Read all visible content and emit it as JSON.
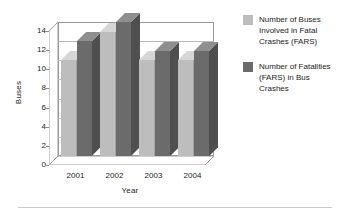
{
  "chart_data": {
    "type": "bar",
    "title": "",
    "subtitle": "",
    "xlabel": "Year",
    "ylabel": "Buses",
    "categories": [
      "2001",
      "2002",
      "2003",
      "2004"
    ],
    "series": [
      {
        "name": "Number of Buses Involved in Fatal Crashes (FARS)",
        "values": [
          10,
          13,
          10,
          10
        ],
        "color": "#bdbdbd"
      },
      {
        "name": "Number of Fatalities (FARS) in Bus Crashes",
        "values": [
          12,
          14,
          11,
          11
        ],
        "color": "#6b6b6b"
      }
    ],
    "ylim": [
      0,
      14
    ],
    "yticks": [
      "0",
      "2",
      "4",
      "6",
      "8",
      "10",
      "12",
      "14"
    ],
    "ytick_values": [
      0,
      2,
      4,
      6,
      8,
      10,
      12,
      14
    ],
    "grid": true,
    "legend_position": "right",
    "style": "3d-column"
  },
  "legend": {
    "entries": [
      {
        "label": "Number of Buses Involved in Fatal Crashes (FARS)",
        "color": "#bdbdbd"
      },
      {
        "label": "Number of Fatalities (FARS) in Bus Crashes",
        "color": "#6b6b6b"
      }
    ]
  },
  "colors": {
    "series_light": "#bdbdbd",
    "series_dark": "#6b6b6b",
    "series_light_top": "#d6d6d6",
    "series_light_side": "#a3a3a3",
    "series_dark_top": "#8f8f8f",
    "series_dark_side": "#4f4f4f",
    "grid": "#b8b8b8",
    "axis": "#9a9a9a",
    "background": "#ffffff",
    "text": "#1a1a1a"
  }
}
